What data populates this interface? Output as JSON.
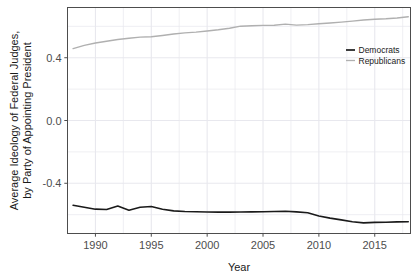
{
  "chart_data": {
    "type": "line",
    "title": "",
    "xlabel": "Year",
    "ylabel": "Average Ideology of Federal Judges,\nby Party of Appointing President",
    "ylabel_line1": "Average Ideology of Federal Judges,",
    "ylabel_line2": "by Party of Appointing President",
    "xlim": [
      1987.5,
      2018.2
    ],
    "ylim": [
      -0.72,
      0.72
    ],
    "xticks": [
      1990,
      1995,
      2000,
      2005,
      2010,
      2015
    ],
    "xtick_labels": [
      "1990",
      "1995",
      "2000",
      "2005",
      "2010",
      "2015"
    ],
    "yticks": [
      0.4,
      0.0,
      -0.4
    ],
    "ytick_labels": [
      "0.4",
      "0.0",
      "-0.4"
    ],
    "minor_yticks": [
      0.6,
      0.2,
      -0.2,
      -0.6
    ],
    "grid": true,
    "grid_color": "#e8e8ee",
    "panel_background": "#ffffff",
    "panel_border_color": "#4d4d4d",
    "legend_position": "top-right-inside",
    "x": [
      1988,
      1989,
      1990,
      1991,
      1992,
      1993,
      1994,
      1995,
      1996,
      1997,
      1998,
      1999,
      2000,
      2001,
      2002,
      2003,
      2004,
      2005,
      2006,
      2007,
      2008,
      2009,
      2010,
      2011,
      2012,
      2013,
      2014,
      2015,
      2016,
      2017,
      2018
    ],
    "series": [
      {
        "name": "Democrats",
        "color": "#1a1a1a",
        "line_width": 1.6,
        "values": [
          -0.54,
          -0.553,
          -0.565,
          -0.567,
          -0.545,
          -0.572,
          -0.553,
          -0.548,
          -0.566,
          -0.576,
          -0.58,
          -0.581,
          -0.583,
          -0.584,
          -0.584,
          -0.583,
          -0.582,
          -0.581,
          -0.58,
          -0.578,
          -0.582,
          -0.588,
          -0.608,
          -0.622,
          -0.633,
          -0.645,
          -0.652,
          -0.649,
          -0.648,
          -0.646,
          -0.645
        ]
      },
      {
        "name": "Republicans",
        "color": "#b0b0b0",
        "line_width": 1.4,
        "values": [
          0.458,
          0.479,
          0.494,
          0.505,
          0.516,
          0.524,
          0.531,
          0.534,
          0.542,
          0.551,
          0.558,
          0.563,
          0.57,
          0.578,
          0.588,
          0.601,
          0.604,
          0.606,
          0.607,
          0.614,
          0.608,
          0.611,
          0.616,
          0.621,
          0.627,
          0.633,
          0.64,
          0.645,
          0.648,
          0.653,
          0.661
        ]
      }
    ]
  },
  "legend": {
    "entries": [
      {
        "label": "Democrats",
        "color": "#1a1a1a"
      },
      {
        "label": "Republicans",
        "color": "#b0b0b0"
      }
    ]
  }
}
